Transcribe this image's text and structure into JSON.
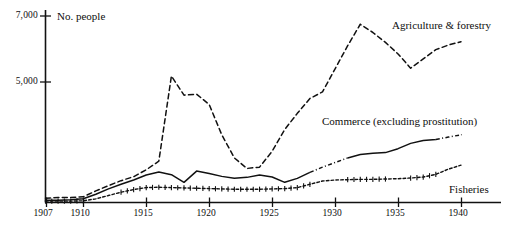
{
  "chart_data": {
    "type": "line",
    "title": "",
    "ylabel": "No. people",
    "xlabel": "",
    "xlim": [
      1907,
      1940
    ],
    "ylim": [
      1350,
      7000
    ],
    "grid": false,
    "legend_position": "inline-annotations",
    "yticks": [
      {
        "value": 7000,
        "label": "7,000"
      },
      {
        "value": 5000,
        "label": "5,000"
      }
    ],
    "xticks": [
      {
        "value": 1907,
        "label": "1907"
      },
      {
        "value": 1910,
        "label": "1910"
      },
      {
        "value": 1915,
        "label": "1915"
      },
      {
        "value": 1920,
        "label": "1920"
      },
      {
        "value": 1925,
        "label": "1925"
      },
      {
        "value": 1930,
        "label": "1930"
      },
      {
        "value": 1935,
        "label": "1935"
      },
      {
        "value": 1940,
        "label": "1940"
      }
    ],
    "x": [
      1907,
      1908,
      1909,
      1910,
      1911,
      1912,
      1913,
      1914,
      1915,
      1916,
      1917,
      1918,
      1919,
      1920,
      1921,
      1922,
      1923,
      1924,
      1925,
      1926,
      1927,
      1928,
      1929,
      1930,
      1931,
      1932,
      1933,
      1934,
      1935,
      1936,
      1937,
      1938,
      1939,
      1940
    ],
    "series": [
      {
        "name": "Agriculture & forestry",
        "style": "dashed",
        "label": "Agriculture & forestry",
        "values": [
          1480,
          1500,
          1500,
          1520,
          1700,
          1860,
          2010,
          2130,
          2340,
          2600,
          5180,
          4600,
          4630,
          4320,
          3400,
          2700,
          2380,
          2420,
          2900,
          3560,
          4050,
          4500,
          4700,
          5400,
          6100,
          6750,
          6500,
          6200,
          5850,
          5420,
          5700,
          5980,
          6120,
          6220
        ]
      },
      {
        "name": "Commerce (excluding prostitution)",
        "style": "solid-dashdot",
        "label": "Commerce (excluding prostitution)",
        "values": [
          1420,
          1420,
          1430,
          1460,
          1600,
          1760,
          1900,
          2030,
          2180,
          2270,
          2190,
          1960,
          2300,
          2230,
          2140,
          2080,
          2110,
          2180,
          2120,
          1960,
          2080,
          2260,
          2420,
          2560,
          2700,
          2800,
          2840,
          2860,
          2980,
          3140,
          3230,
          3260,
          3330,
          3400
        ]
      },
      {
        "name": "Fisheries",
        "style": "dotted-cross",
        "label": "Fisheries",
        "values": [
          1390,
          1390,
          1390,
          1400,
          1460,
          1560,
          1660,
          1740,
          1800,
          1810,
          1800,
          1790,
          1780,
          1770,
          1760,
          1750,
          1750,
          1750,
          1760,
          1770,
          1800,
          1900,
          2000,
          2030,
          2040,
          2050,
          2050,
          2060,
          2070,
          2090,
          2120,
          2200,
          2360,
          2480
        ]
      }
    ],
    "annotations": [
      {
        "text": "No. people",
        "x_px": 57,
        "y_px": 11
      },
      {
        "text": "Agriculture & forestry",
        "x_px": 392,
        "y_px": 20
      },
      {
        "text": "Commerce (excluding prostitution)",
        "x_px": 322,
        "y_px": 116
      },
      {
        "text": "Fisheries",
        "x_px": 449,
        "y_px": 184
      }
    ]
  },
  "axis": {
    "y_title": "No. people",
    "y_labels": [
      "7,000",
      "5,000"
    ],
    "x_labels": [
      "1907",
      "1910",
      "1915",
      "1920",
      "1925",
      "1930",
      "1935",
      "1940"
    ]
  },
  "series_labels": {
    "agriculture": "Agriculture & forestry",
    "commerce": "Commerce (excluding prostitution)",
    "fisheries": "Fisheries"
  },
  "colors": {
    "ink": "#111111",
    "background": "#ffffff"
  }
}
